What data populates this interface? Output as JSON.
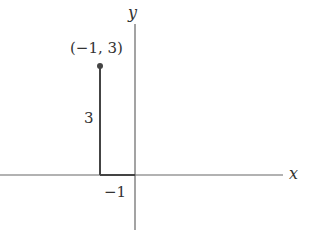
{
  "diagram": {
    "x_axis_label": "x",
    "y_axis_label": "y",
    "point_label": "(−1, 3)",
    "height_label": "3",
    "x_tick_label": "−1",
    "point": {
      "x": -1,
      "y": 3
    },
    "colors": {
      "axis": "#555555",
      "segment": "#444444",
      "point": "#444444"
    }
  }
}
